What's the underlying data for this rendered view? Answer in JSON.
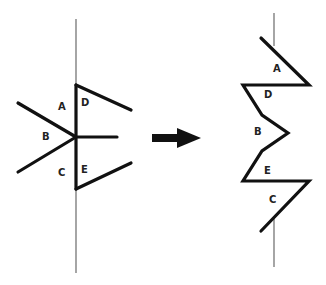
{
  "diagram": {
    "colors": {
      "stroke": "#111111",
      "axis": "#6a6a6a",
      "background": "#ffffff"
    },
    "left_figure": {
      "labels": {
        "A": "A",
        "B": "B",
        "C": "C",
        "D": "D",
        "E": "E"
      }
    },
    "arrow": {
      "icon": "right-arrow-icon",
      "direction": "right"
    },
    "right_figure": {
      "labels": {
        "A": "A",
        "D": "D",
        "B": "B",
        "E": "E",
        "C": "C"
      }
    }
  }
}
